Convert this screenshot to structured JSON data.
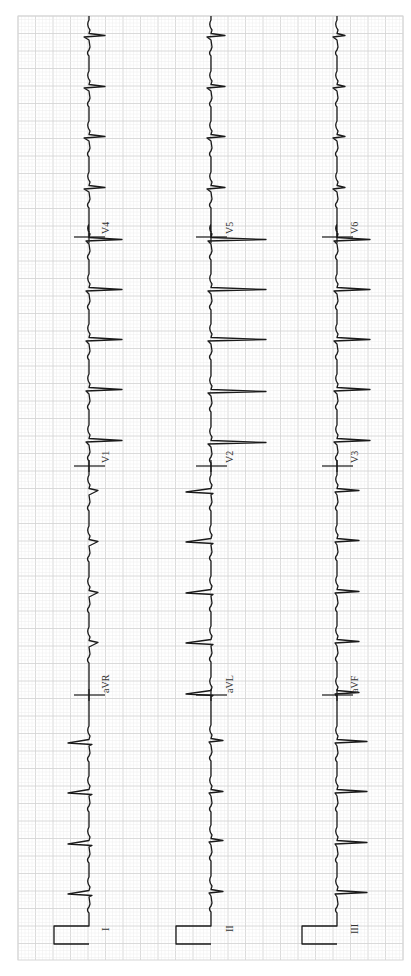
{
  "chart_data": {
    "type": "line",
    "orientation": "rotated-ccw-90",
    "grid": {
      "on": true,
      "minor_color": "#ececec",
      "major_color": "#d6d6d6",
      "minor_px": 3.5,
      "major_px": 17.5,
      "x0": 18,
      "y0": 16,
      "x1": 403,
      "y1": 960
    },
    "calibration": {
      "height_px": 35,
      "width_px": 18
    },
    "rows": [
      {
        "baseline_x": 89,
        "cal_top_y": 926,
        "cal_bottom_y": 944,
        "row_label": "I",
        "segments": [
          {
            "lead": "I",
            "y_start": 926,
            "y_end": 695,
            "beats": [
              893,
              843,
              792,
              742
            ],
            "r": 21,
            "s": 0,
            "q": 3
          },
          {
            "lead": "aVR",
            "y_start": 695,
            "y_end": 466,
            "beats": [
              643,
              593,
              542,
              491
            ],
            "r": 0,
            "s": 9,
            "q": 0
          },
          {
            "lead": "V1",
            "y_start": 466,
            "y_end": 237,
            "beats": [
              441,
              390,
              340,
              290,
              240
            ],
            "r": 3,
            "s": 33,
            "q": 0
          },
          {
            "lead": "V4",
            "y_start": 237,
            "y_end": 16,
            "beats": [
              188,
              137,
              87,
              36
            ],
            "r": 5,
            "s": 16,
            "q": 0
          }
        ]
      },
      {
        "baseline_x": 211,
        "cal_top_y": 926,
        "cal_bottom_y": 944,
        "row_label": "II",
        "segments": [
          {
            "lead": "II",
            "y_start": 926,
            "y_end": 695,
            "beats": [
              892,
              841,
              792,
              741
            ],
            "r": 2,
            "s": 12,
            "q": 0
          },
          {
            "lead": "aVL",
            "y_start": 695,
            "y_end": 466,
            "beats": [
              693,
              642,
              592,
              541,
              491
            ],
            "r": 25,
            "s": 0,
            "q": 2
          },
          {
            "lead": "V2",
            "y_start": 466,
            "y_end": 237,
            "beats": [
              443,
              392,
              340,
              290,
              240
            ],
            "r": 3,
            "s": 55,
            "q": 0
          },
          {
            "lead": "V5",
            "y_start": 237,
            "y_end": 16,
            "beats": [
              188,
              137,
              87,
              36
            ],
            "r": 4,
            "s": 14,
            "q": 0
          }
        ]
      },
      {
        "baseline_x": 337,
        "cal_top_y": 926,
        "cal_bottom_y": 944,
        "row_label": "III",
        "segments": [
          {
            "lead": "III",
            "y_start": 926,
            "y_end": 695,
            "beats": [
              893,
              843,
              792,
              742
            ],
            "r": 2,
            "s": 30,
            "q": 0
          },
          {
            "lead": "aVF",
            "y_start": 695,
            "y_end": 466,
            "beats": [
              693,
              642,
              592,
              541,
              491
            ],
            "r": 2,
            "s": 22,
            "q": 0
          },
          {
            "lead": "V3",
            "y_start": 466,
            "y_end": 237,
            "beats": [
              441,
              390,
              340,
              290,
              240
            ],
            "r": 3,
            "s": 33,
            "q": 0
          },
          {
            "lead": "V6",
            "y_start": 237,
            "y_end": 16,
            "beats": [
              188,
              137,
              87,
              36
            ],
            "r": 4,
            "s": 8,
            "q": 0
          }
        ]
      }
    ],
    "separators_y": [
      695,
      466,
      237
    ],
    "lead_labels": [
      {
        "text": "I",
        "x": 100,
        "y": 931
      },
      {
        "text": "II",
        "x": 224,
        "y": 932
      },
      {
        "text": "III",
        "x": 349,
        "y": 934
      },
      {
        "text": "aVR",
        "x": 100,
        "y": 693
      },
      {
        "text": "aVL",
        "x": 224,
        "y": 693
      },
      {
        "text": "aVF",
        "x": 349,
        "y": 693
      },
      {
        "text": "V1",
        "x": 100,
        "y": 463
      },
      {
        "text": "V2",
        "x": 224,
        "y": 463
      },
      {
        "text": "V3",
        "x": 349,
        "y": 463
      },
      {
        "text": "V4",
        "x": 100,
        "y": 234
      },
      {
        "text": "V5",
        "x": 224,
        "y": 234
      },
      {
        "text": "V6",
        "x": 349,
        "y": 234
      }
    ],
    "heart_rate_note": "regular rhythm, RR ≈ 50px (~2.9 large boxes)",
    "xlabel": "",
    "ylabel": ""
  }
}
